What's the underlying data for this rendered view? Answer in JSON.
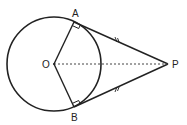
{
  "diagram": {
    "type": "geometry-tangents",
    "labels": {
      "center": "O",
      "tangent_point_top": "A",
      "tangent_point_bottom": "B",
      "external_point": "P"
    },
    "colors": {
      "stroke": "#222222",
      "background": "#ffffff"
    }
  }
}
